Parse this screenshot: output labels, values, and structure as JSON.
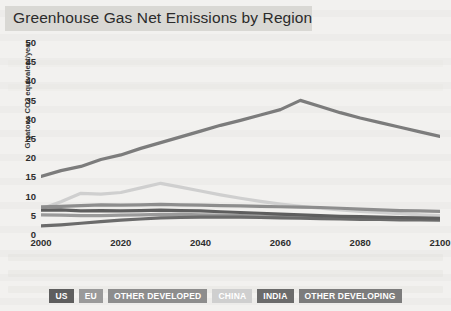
{
  "title": "Greenhouse Gas Net Emissions by Region",
  "legend": {
    "items": [
      {
        "label": "US",
        "color": "#5e5e5e"
      },
      {
        "label": "EU",
        "color": "#9a9a9a"
      },
      {
        "label": "OTHER DEVELOPED",
        "color": "#8d8d8d"
      },
      {
        "label": "CHINA",
        "color": "#cfcfcf"
      },
      {
        "label": "INDIA",
        "color": "#6b6b6b"
      },
      {
        "label": "OTHER DEVELOPING",
        "color": "#7c7c7c"
      }
    ]
  },
  "chart_data": {
    "type": "line",
    "title": "Greenhouse Gas Net Emissions by Region",
    "xlabel": "",
    "ylabel": "Gigatons CO2 equivalent/year",
    "xlim": [
      2000,
      2100
    ],
    "ylim": [
      0,
      50
    ],
    "xticks": [
      2000,
      2020,
      2040,
      2060,
      2080,
      2100
    ],
    "yticks": [
      0,
      5,
      10,
      15,
      20,
      25,
      30,
      35,
      40,
      45,
      50
    ],
    "grid": false,
    "legend_position": "bottom",
    "x": [
      2000,
      2005,
      2010,
      2015,
      2020,
      2025,
      2030,
      2035,
      2040,
      2045,
      2050,
      2055,
      2060,
      2065,
      2070,
      2075,
      2080,
      2085,
      2090,
      2095,
      2100
    ],
    "series": [
      {
        "name": "OTHER DEVELOPING",
        "color": "#7c7c7c",
        "values": [
          15.0,
          16.5,
          17.6,
          19.4,
          20.6,
          22.3,
          23.8,
          25.3,
          26.8,
          28.3,
          29.6,
          31.0,
          32.4,
          34.8,
          33.2,
          31.6,
          30.2,
          29.0,
          27.8,
          26.6,
          25.4
        ]
      },
      {
        "name": "CHINA",
        "color": "#cfcfcf",
        "values": [
          6.5,
          8.4,
          10.6,
          10.4,
          10.8,
          12.0,
          13.2,
          12.2,
          11.2,
          10.2,
          9.3,
          8.5,
          7.8,
          7.2,
          6.7,
          6.3,
          5.9,
          5.6,
          5.3,
          5.0,
          4.8
        ]
      },
      {
        "name": "OTHER DEVELOPED",
        "color": "#8d8d8d",
        "values": [
          7.1,
          7.2,
          7.4,
          7.6,
          7.5,
          7.6,
          7.7,
          7.6,
          7.5,
          7.4,
          7.3,
          7.2,
          7.1,
          7.0,
          6.9,
          6.7,
          6.5,
          6.3,
          6.1,
          6.0,
          5.9
        ]
      },
      {
        "name": "US",
        "color": "#5e5e5e",
        "values": [
          6.2,
          6.3,
          6.0,
          6.1,
          6.0,
          6.1,
          6.2,
          6.1,
          6.0,
          5.8,
          5.6,
          5.4,
          5.2,
          5.0,
          4.8,
          4.6,
          4.5,
          4.4,
          4.3,
          4.2,
          4.1
        ]
      },
      {
        "name": "EU",
        "color": "#9a9a9a",
        "values": [
          5.0,
          4.9,
          4.8,
          4.8,
          4.9,
          5.0,
          5.1,
          5.1,
          5.0,
          4.9,
          4.8,
          4.7,
          4.6,
          4.5,
          4.4,
          4.3,
          4.2,
          4.1,
          4.1,
          4.0,
          4.0
        ]
      },
      {
        "name": "INDIA",
        "color": "#6b6b6b",
        "values": [
          2.1,
          2.4,
          2.8,
          3.2,
          3.6,
          3.9,
          4.2,
          4.3,
          4.4,
          4.4,
          4.4,
          4.3,
          4.2,
          4.1,
          4.0,
          3.9,
          3.8,
          3.8,
          3.7,
          3.7,
          3.6
        ]
      }
    ]
  }
}
